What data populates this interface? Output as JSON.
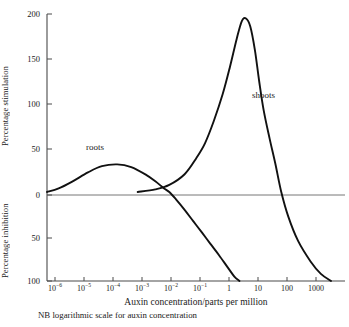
{
  "chart_data": {
    "type": "line",
    "title": "",
    "xlabel": "Auxin concentration/parts per million",
    "xlabel_note": "NB logarithmic scale for auxin concentration",
    "ylabel_upper": "Percentage stimulation",
    "ylabel_lower": "Percentage inhibition",
    "xscale": "log",
    "xlim": [
      4e-07,
      6000
    ],
    "ylim": [
      -100,
      200
    ],
    "grid": false,
    "legend_position": "inline-annotations",
    "x_ticks": [
      {
        "value": 1e-06,
        "label": "10",
        "exponent": "−6"
      },
      {
        "value": 1e-05,
        "label": "10",
        "exponent": "−5"
      },
      {
        "value": 0.0001,
        "label": "10",
        "exponent": "−4"
      },
      {
        "value": 0.001,
        "label": "10",
        "exponent": "−3"
      },
      {
        "value": 0.01,
        "label": "10",
        "exponent": "−2"
      },
      {
        "value": 0.1,
        "label": "10",
        "exponent": "−1"
      },
      {
        "value": 1,
        "label": "1",
        "exponent": ""
      },
      {
        "value": 10,
        "label": "10",
        "exponent": ""
      },
      {
        "value": 100,
        "label": "100",
        "exponent": ""
      },
      {
        "value": 1000,
        "label": "1000",
        "exponent": ""
      }
    ],
    "y_ticks_upper": [
      {
        "value": 200,
        "label": "200"
      },
      {
        "value": 150,
        "label": "150"
      },
      {
        "value": 100,
        "label": "100"
      },
      {
        "value": 50,
        "label": "50"
      },
      {
        "value": 0,
        "label": "0"
      }
    ],
    "y_ticks_lower": [
      {
        "value": -50,
        "label": "50"
      },
      {
        "value": -100,
        "label": "100"
      }
    ],
    "zero_line": 0,
    "series": [
      {
        "name": "roots",
        "annotation": "roots",
        "color": "#111111",
        "points": [
          [
            4e-07,
            0
          ],
          [
            1e-06,
            4
          ],
          [
            3e-06,
            12
          ],
          [
            1e-05,
            22
          ],
          [
            3e-05,
            29
          ],
          [
            0.0001,
            31
          ],
          [
            0.0003,
            28
          ],
          [
            0.001,
            19
          ],
          [
            0.002,
            12
          ],
          [
            0.004,
            4
          ],
          [
            0.006,
            0
          ],
          [
            0.01,
            -8
          ],
          [
            0.02,
            -20
          ],
          [
            0.04,
            -33
          ],
          [
            0.08,
            -46
          ],
          [
            0.15,
            -58
          ],
          [
            0.3,
            -71
          ],
          [
            0.6,
            -85
          ],
          [
            1.0,
            -95
          ],
          [
            1.5,
            -100
          ]
        ]
      },
      {
        "name": "shoots",
        "annotation": "shoots",
        "color": "#111111",
        "points": [
          [
            0.0005,
            0
          ],
          [
            0.002,
            3
          ],
          [
            0.006,
            8
          ],
          [
            0.02,
            20
          ],
          [
            0.05,
            38
          ],
          [
            0.1,
            55
          ],
          [
            0.2,
            80
          ],
          [
            0.4,
            110
          ],
          [
            0.7,
            140
          ],
          [
            1.2,
            172
          ],
          [
            1.8,
            192
          ],
          [
            2.5,
            195
          ],
          [
            3.5,
            186
          ],
          [
            5,
            160
          ],
          [
            7,
            125
          ],
          [
            10,
            92
          ],
          [
            16,
            60
          ],
          [
            25,
            32
          ],
          [
            40,
            0
          ],
          [
            70,
            -28
          ],
          [
            150,
            -55
          ],
          [
            400,
            -78
          ],
          [
            900,
            -92
          ],
          [
            2000,
            -100
          ]
        ]
      }
    ]
  },
  "geometry": {
    "plot_left": 47,
    "plot_right": 345,
    "plot_top": 14,
    "plot_bottom": 281,
    "zero_y": 195
  }
}
